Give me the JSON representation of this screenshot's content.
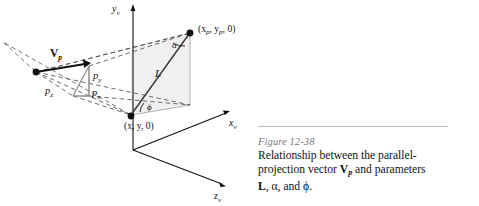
{
  "figure": {
    "axes": [
      {
        "id": "y-axis",
        "label": "y",
        "subscript": "v"
      },
      {
        "id": "x-axis",
        "label": "x",
        "subscript": "v"
      },
      {
        "id": "z-axis",
        "label": "z",
        "subscript": "v"
      }
    ],
    "points": [
      {
        "id": "projected-point",
        "label": "(x",
        "sub1": "p",
        "mid": ", y",
        "sub2": "p",
        "tail": ", 0)"
      },
      {
        "id": "source-point",
        "label": "(x, y, 0)"
      }
    ],
    "vector": {
      "id": "projection-vector",
      "label": "V",
      "subscript": "p"
    },
    "components": [
      {
        "id": "component-py",
        "label": "p",
        "subscript": "y"
      },
      {
        "id": "component-px",
        "label": "p",
        "subscript": "x"
      },
      {
        "id": "component-pz",
        "label": "p",
        "subscript": "z"
      }
    ],
    "length": {
      "id": "length-L",
      "label": "L"
    },
    "angles": [
      {
        "id": "angle-alpha",
        "label": "α"
      },
      {
        "id": "angle-phi",
        "label": "ϕ"
      }
    ],
    "colors": {
      "ink": "#111111",
      "dashed": "#4a4a4a",
      "light_fill": "#e8e8e8",
      "light_stroke": "#9a9a9a",
      "rule": "#b9b9b9",
      "caption_figno": "#7a7a7a"
    }
  },
  "caption": {
    "figure_number": "Figure 12-38",
    "line1": "Relationship between the parallel-",
    "line2_a": "projection vector ",
    "line2_vector": "V",
    "line2_vector_sub": "p",
    "line2_b": " and parameters",
    "line3_a": "L",
    "line3_b": ", α, and ϕ."
  }
}
